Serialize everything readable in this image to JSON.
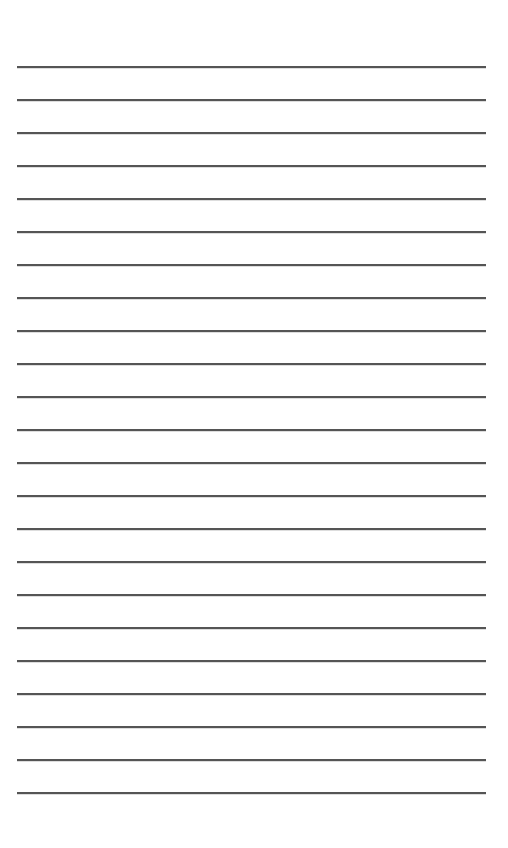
{
  "page": {
    "type": "lined-paper",
    "background_color": "#ffffff",
    "line_color": "#555555",
    "line_count": 23,
    "first_line_y": 66,
    "line_spacing": 33,
    "line_left": 17,
    "line_right": 486,
    "lines": [
      {
        "text": ""
      },
      {
        "text": ""
      },
      {
        "text": ""
      },
      {
        "text": ""
      },
      {
        "text": ""
      },
      {
        "text": ""
      },
      {
        "text": ""
      },
      {
        "text": ""
      },
      {
        "text": ""
      },
      {
        "text": ""
      },
      {
        "text": ""
      },
      {
        "text": ""
      },
      {
        "text": ""
      },
      {
        "text": ""
      },
      {
        "text": ""
      },
      {
        "text": ""
      },
      {
        "text": ""
      },
      {
        "text": ""
      },
      {
        "text": ""
      },
      {
        "text": ""
      },
      {
        "text": ""
      },
      {
        "text": ""
      },
      {
        "text": ""
      }
    ]
  }
}
